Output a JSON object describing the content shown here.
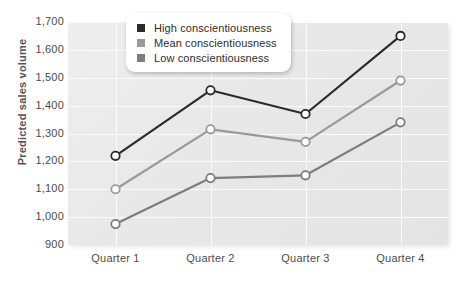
{
  "chart_data": {
    "type": "line",
    "title": "",
    "xlabel": "",
    "ylabel": "Predicted sales volume",
    "categories": [
      "Quarter 1",
      "Quarter 2",
      "Quarter 3",
      "Quarter 4"
    ],
    "yticks": [
      "900",
      "1,000",
      "1,100",
      "1,200",
      "1,300",
      "1,400",
      "1,500",
      "1,600",
      "1,700"
    ],
    "ytick_values": [
      900,
      1000,
      1100,
      1200,
      1300,
      1400,
      1500,
      1600,
      1700
    ],
    "ylim": [
      900,
      1700
    ],
    "grid": true,
    "legend_position": "top-center",
    "series": [
      {
        "name": "High conscientiousness",
        "values": [
          1220,
          1455,
          1370,
          1650
        ],
        "color": "#2b2b2b"
      },
      {
        "name": "Mean conscientiousness",
        "values": [
          1100,
          1315,
          1270,
          1490
        ],
        "color": "#9a9a9a"
      },
      {
        "name": "Low conscientiousness",
        "values": [
          975,
          1140,
          1150,
          1340
        ],
        "color": "#7d7d7d"
      }
    ]
  },
  "legend": {
    "items": [
      {
        "label": "High conscientiousness",
        "color": "#2b2b2b"
      },
      {
        "label": "Mean conscientiousness",
        "color": "#9a9a9a"
      },
      {
        "label": "Low conscientiousness",
        "color": "#7d7d7d"
      }
    ]
  },
  "colors": {
    "plot_background": "#e9e9e9",
    "gridline": "#fbfbfb",
    "axis_text": "#4c4c4c",
    "axis_label": "#555555",
    "marker_fill": "#ffffff"
  }
}
